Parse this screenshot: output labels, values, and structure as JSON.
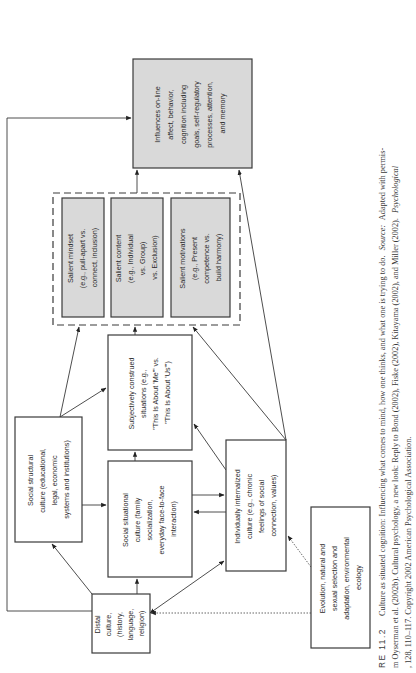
{
  "figure": {
    "orientation": "rotated-90-ccw",
    "nodes": {
      "influences": {
        "lines": [
          "Influences on-line",
          "affect, behavior,",
          "cognition including",
          "goals, self-regulatory",
          "processes, attention,",
          "and memory"
        ]
      },
      "salient_mindset": {
        "lines": [
          "Salient mindset",
          "(e.g., pull-apart vs.",
          "connect, inclusion)"
        ]
      },
      "salient_content": {
        "lines": [
          "Salient content",
          "(e.g., Individual",
          "vs. Group)",
          "vs. Exclusion)"
        ]
      },
      "salient_motivations": {
        "lines": [
          "Salient motivations",
          "(e.g., Present",
          "competence vs.",
          "build harmony)"
        ]
      },
      "subjectively_construed": {
        "lines": [
          "Subjectively construed",
          "situations (e.g.,",
          "\"This Is About 'Me'\" vs.",
          "\"This Is About 'Us'\")"
        ]
      },
      "social_structural": {
        "lines": [
          "Social structural",
          "culture (educational,",
          "legal, economic",
          "systems and institutions)"
        ]
      },
      "social_situational": {
        "lines": [
          "Social situational",
          "culture (family",
          "socialization,",
          "everyday face-to-face",
          "interaction)"
        ]
      },
      "individually_internalized": {
        "lines": [
          "Individually internalized",
          "culture (e.g., chronic",
          "feelings of social",
          "connection, values)"
        ]
      },
      "distal_culture": {
        "lines": [
          "Distal",
          "culture,",
          "(history,",
          "language,",
          "religion)"
        ]
      },
      "evolution": {
        "lines": [
          "Evolution, natural and",
          "sexual selection and",
          "adaptation, environmental",
          "ecology"
        ]
      }
    },
    "caption": {
      "line1_prefix": "RE 11.2",
      "line1_text": "Culture as situated cognition: Influencing what comes to mind, how one thinks, and what one is trying to do.",
      "line1_source_label": "Source:",
      "line1_source_text": "Adapted with permis-",
      "line2_text": "m Oyserman et al. (2002b). Cultural psychology, a new look: Reply to Bond (2002), Fiske (2002), Kitayama (2002), and Miller (2002).",
      "line2_journal": "Psychological",
      "line3_text": ", 128, 110–117. Copyright 2002 American Psychological Association."
    },
    "colors": {
      "outcome_fill": "#d9d9d9",
      "salient_fill": "#d9d9d9",
      "stroke": "#3a3a3a",
      "background": "#ffffff"
    }
  }
}
